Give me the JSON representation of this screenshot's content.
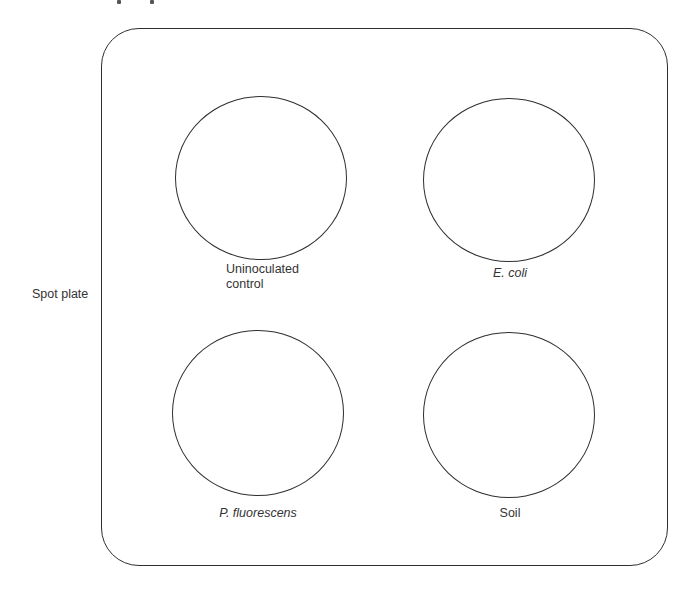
{
  "figure": {
    "title": "Spot plate",
    "side_label": "Spot plate",
    "plate": {
      "shape": "rounded-rectangle",
      "stroke_color": "#2f2f2f"
    },
    "wells": [
      {
        "id": "uninoculated-control",
        "label_line1": "Uninoculated",
        "label_line2": "control",
        "italic": false,
        "position": "top-left"
      },
      {
        "id": "e-coli",
        "label_line1": "E. coli",
        "label_line2": "",
        "italic": true,
        "position": "top-right"
      },
      {
        "id": "p-fluorescens",
        "label_line1": "P. fluorescens",
        "label_line2": "",
        "italic": true,
        "position": "bottom-left"
      },
      {
        "id": "soil",
        "label_line1": "Soil",
        "label_line2": "",
        "italic": false,
        "position": "bottom-right"
      }
    ]
  }
}
